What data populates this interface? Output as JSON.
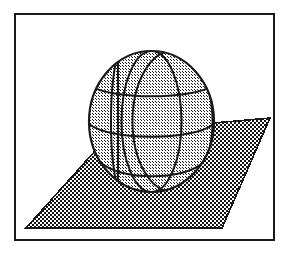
{
  "figure": {
    "canvas": {
      "width": 289,
      "height": 254,
      "background": "#ffffff"
    },
    "frame": {
      "label": "figure-border",
      "x": 15,
      "y": 14,
      "width": 259,
      "height": 226,
      "stroke": "#1a1a1a",
      "stroke_width": 2,
      "fill": "none"
    },
    "plane": {
      "label": "ground-plane",
      "shape": "parallelogram",
      "points": "26,228 112,132 270,118 222,228",
      "fill_pattern": "checkerboard-50",
      "fill_color": "#6e6e6e",
      "stroke": "#1a1a1a",
      "stroke_width": 1.6
    },
    "sphere": {
      "label": "wireframe-sphere",
      "center_x": 151.5,
      "center_y": 121.5,
      "radius_x": 62.5,
      "radius_y": 70.5,
      "fill_pattern": "checkerboard-25",
      "fill_color": "#b8b8b8",
      "stroke": "#1a1a1a",
      "stroke_width": 2,
      "meridian_count": 4,
      "parallel_count": 3,
      "meridians": [
        {
          "name": "meridian-left-limb",
          "rx": 62.5
        },
        {
          "name": "meridian-left-inner",
          "rx": 30.0
        },
        {
          "name": "meridian-center",
          "rx": 3.0
        },
        {
          "name": "meridian-right-inner",
          "rx": 40.0
        }
      ],
      "parallels": [
        {
          "name": "parallel-upper",
          "cy_offset": -46,
          "rx": 48.0,
          "ry": 13.0
        },
        {
          "name": "parallel-equator",
          "cy_offset": 2,
          "rx": 62.5,
          "ry": 17.0
        },
        {
          "name": "parallel-lower",
          "cy_offset": 48,
          "rx": 47.0,
          "ry": 13.0
        }
      ]
    },
    "colors": {
      "ink": "#1a1a1a",
      "paper": "#ffffff",
      "plane_tone": "#6e6e6e",
      "sphere_tone": "#b8b8b8"
    }
  }
}
